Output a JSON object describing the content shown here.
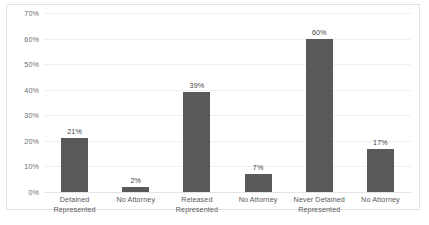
{
  "chart_data": {
    "type": "bar",
    "title": "",
    "xlabel": "",
    "ylabel": "",
    "categories": [
      "Detained Represented",
      "No Attorney",
      "Released Represented",
      "No Attorney",
      "Never Detained Represented",
      "No Attorney"
    ],
    "category_lines": [
      [
        "Detained",
        "Represented"
      ],
      [
        "No Attorney",
        ""
      ],
      [
        "Released",
        "Represented"
      ],
      [
        "No Attorney",
        ""
      ],
      [
        "Never Detained",
        "Represented"
      ],
      [
        "No Attorney",
        ""
      ]
    ],
    "values": [
      21,
      2,
      39,
      7,
      60,
      17
    ],
    "data_labels": [
      "21%",
      "2%",
      "39%",
      "7%",
      "60%",
      "17%"
    ],
    "ylim": [
      0,
      70
    ],
    "ytick_values": [
      0,
      10,
      20,
      30,
      40,
      50,
      60,
      70
    ],
    "ytick_labels": [
      "0%",
      "10%",
      "20%",
      "30%",
      "40%",
      "50%",
      "60%",
      "70%"
    ],
    "grid": true,
    "legend": null,
    "legend_position": "none",
    "bar_color": "#595959",
    "gridline_color": "#efefef",
    "axis_text_color": "#595959",
    "frame_color": "#e2e2e2",
    "background_color": "#ffffff"
  }
}
